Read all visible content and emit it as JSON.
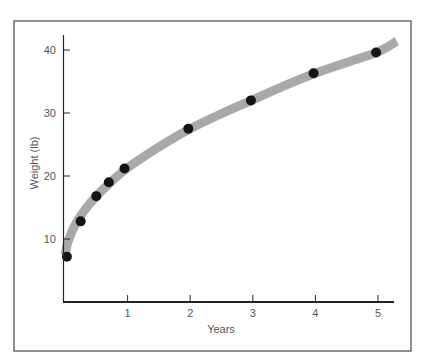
{
  "chart_data": {
    "type": "scatter",
    "title": "",
    "xlabel": "Years",
    "ylabel": "Weight (lb)",
    "xlim": [
      0,
      5.3
    ],
    "ylim": [
      0,
      43
    ],
    "grid": false,
    "legend": null,
    "x_ticks": [
      1,
      2,
      3,
      4,
      5
    ],
    "x_tick_labels": [
      "1",
      "2",
      "3",
      "4",
      "5"
    ],
    "y_ticks": [
      10,
      20,
      30,
      40
    ],
    "y_tick_labels": [
      "10",
      "20",
      "30",
      "40"
    ],
    "series": [
      {
        "name": "Observed weight",
        "kind": "points",
        "x": [
          0.03,
          0.25,
          0.5,
          0.7,
          0.95,
          1.97,
          2.97,
          3.97,
          4.97
        ],
        "y": [
          7.2,
          12.8,
          16.8,
          19.0,
          21.2,
          27.5,
          32.0,
          36.3,
          39.6
        ]
      },
      {
        "name": "Fitted growth curve",
        "kind": "line",
        "x": [
          0.0,
          0.05,
          0.15,
          0.3,
          0.5,
          0.75,
          1.0,
          1.5,
          2.0,
          2.5,
          3.0,
          3.5,
          4.0,
          4.5,
          5.0,
          5.3
        ],
        "y": [
          7.5,
          9.6,
          12.0,
          14.4,
          16.8,
          19.2,
          21.3,
          24.6,
          27.5,
          29.9,
          32.1,
          34.3,
          36.3,
          38.0,
          39.7,
          41.4
        ]
      }
    ]
  },
  "colors": {
    "points": "#141414",
    "curve": "#a9a9a9",
    "axis": "#222222",
    "frame": "#555555",
    "text": "#555555"
  }
}
